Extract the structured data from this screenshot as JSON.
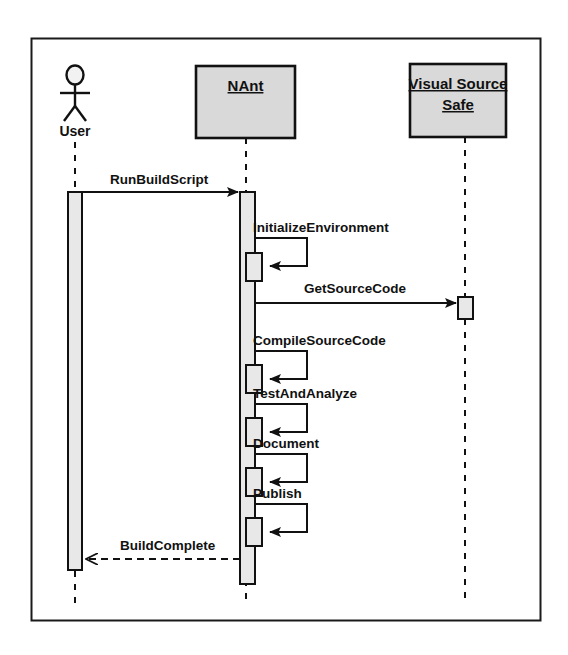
{
  "diagram": {
    "type": "uml-sequence-diagram",
    "frame": {
      "x": 31,
      "y": 38,
      "width": 509,
      "height": 582,
      "border_color": "#1a1a1a",
      "background": "#ffffff"
    },
    "styles": {
      "box_fill": "#d9d9d9",
      "activation_fill": "#e3e3e3",
      "line_color": "#111111",
      "lifeline_style": "dashed"
    },
    "participants": [
      {
        "id": "user",
        "name": "User",
        "kind": "actor",
        "label": "User",
        "icon": "actor-stick-figure-icon",
        "center_x": 75,
        "label_y": 131,
        "lifeline_top": 138,
        "lifeline_bottom": 604
      },
      {
        "id": "nant",
        "name": "NAnt",
        "kind": "object",
        "label": "NAnt",
        "underlined": true,
        "box": {
          "x": 196,
          "y": 66,
          "width": 99,
          "height": 72
        },
        "center_x": 246,
        "lifeline_top": 138,
        "lifeline_bottom": 604
      },
      {
        "id": "vss",
        "name": "Visual Source Safe",
        "kind": "object",
        "label_lines": [
          "Visual Source",
          "Safe"
        ],
        "underlined": true,
        "box": {
          "x": 410,
          "y": 64,
          "width": 96,
          "height": 73
        },
        "center_x": 465,
        "lifeline_top": 137,
        "lifeline_bottom": 604
      }
    ],
    "activations": [
      {
        "id": "user-activation",
        "participant": "user",
        "x": 68,
        "y": 192,
        "width": 14,
        "height": 378
      },
      {
        "id": "nant-activation",
        "participant": "nant",
        "x": 240,
        "y": 192,
        "width": 15,
        "height": 392
      },
      {
        "id": "nant-nested-initializeenvironment",
        "participant": "nant",
        "x": 246,
        "y": 253,
        "width": 16,
        "height": 28
      },
      {
        "id": "vss-activation-getsourcecode",
        "participant": "vss",
        "x": 458,
        "y": 297,
        "width": 15,
        "height": 22
      },
      {
        "id": "nant-nested-compilesourcecode",
        "participant": "nant",
        "x": 246,
        "y": 365,
        "width": 16,
        "height": 28
      },
      {
        "id": "nant-nested-testandanalyze",
        "participant": "nant",
        "x": 246,
        "y": 418,
        "width": 16,
        "height": 28
      },
      {
        "id": "nant-nested-document",
        "participant": "nant",
        "x": 246,
        "y": 468,
        "width": 16,
        "height": 28
      },
      {
        "id": "nant-nested-publish",
        "participant": "nant",
        "x": 246,
        "y": 518,
        "width": 16,
        "height": 28
      }
    ],
    "messages": [
      {
        "id": "msg-runbuildscript",
        "label": "RunBuildScript",
        "from": "user",
        "to": "nant",
        "kind": "call",
        "line": "solid",
        "arrowhead": "filled",
        "y": 192,
        "x1": 82,
        "x2": 240,
        "label_x": 110,
        "label_y": 184,
        "label_anchor": "start"
      },
      {
        "id": "msg-initializeenvironment",
        "label": "InitializeEnvironment",
        "from": "nant",
        "to": "nant",
        "kind": "self-call",
        "line": "solid",
        "arrowhead": "filled",
        "y_out": 238,
        "y_back": 266,
        "x_start": 255,
        "x_extent": 307,
        "label_x": 253,
        "label_y": 232,
        "label_anchor": "start"
      },
      {
        "id": "msg-getsourcecode",
        "label": "GetSourceCode",
        "from": "nant",
        "to": "vss",
        "kind": "call",
        "line": "solid",
        "arrowhead": "filled",
        "y": 303,
        "x1": 255,
        "x2": 458,
        "label_x": 355,
        "label_y": 293,
        "label_anchor": "middle"
      },
      {
        "id": "msg-compilesourcecode",
        "label": "CompileSourceCode",
        "from": "nant",
        "to": "nant",
        "kind": "self-call",
        "line": "solid",
        "arrowhead": "filled",
        "y_out": 351,
        "y_back": 379,
        "x_start": 255,
        "x_extent": 307,
        "label_x": 253,
        "label_y": 345,
        "label_anchor": "start"
      },
      {
        "id": "msg-testandanalyze",
        "label": "TestAndAnalyze",
        "from": "nant",
        "to": "nant",
        "kind": "self-call",
        "line": "solid",
        "arrowhead": "filled",
        "y_out": 404,
        "y_back": 432,
        "x_start": 255,
        "x_extent": 307,
        "label_x": 253,
        "label_y": 398,
        "label_anchor": "start"
      },
      {
        "id": "msg-document",
        "label": "Document",
        "from": "nant",
        "to": "nant",
        "kind": "self-call",
        "line": "solid",
        "arrowhead": "filled",
        "y_out": 454,
        "y_back": 482,
        "x_start": 255,
        "x_extent": 307,
        "label_x": 253,
        "label_y": 448,
        "label_anchor": "start"
      },
      {
        "id": "msg-publish",
        "label": "Publish",
        "from": "nant",
        "to": "nant",
        "kind": "self-call",
        "line": "solid",
        "arrowhead": "filled",
        "y_out": 504,
        "y_back": 532,
        "x_start": 255,
        "x_extent": 307,
        "label_x": 253,
        "label_y": 498,
        "label_anchor": "start"
      },
      {
        "id": "msg-buildcomplete",
        "label": "BuildComplete",
        "from": "nant",
        "to": "user",
        "kind": "return",
        "line": "dashed",
        "arrowhead": "open",
        "y": 559,
        "x1": 240,
        "x2": 82,
        "label_x": 120,
        "label_y": 550,
        "label_anchor": "start"
      }
    ]
  }
}
